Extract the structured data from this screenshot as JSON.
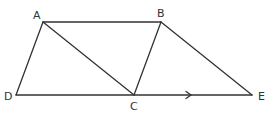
{
  "diagram": {
    "type": "geometry",
    "stroke_color": "#333333",
    "label_color": "#333333",
    "points": {
      "A": {
        "label": "A",
        "x": 43,
        "y": 22
      },
      "B": {
        "label": "B",
        "x": 161,
        "y": 22
      },
      "C": {
        "label": "C",
        "x": 134,
        "y": 95
      },
      "D": {
        "label": "D",
        "x": 16,
        "y": 95
      },
      "E": {
        "label": "E",
        "x": 252,
        "y": 95
      }
    },
    "segments": [
      {
        "from": "A",
        "to": "B"
      },
      {
        "from": "A",
        "to": "D"
      },
      {
        "from": "A",
        "to": "C"
      },
      {
        "from": "B",
        "to": "C"
      },
      {
        "from": "B",
        "to": "E"
      },
      {
        "from": "D",
        "to": "E"
      }
    ],
    "annotations": [
      {
        "type": "direction-arrow",
        "on_segment": "C-E",
        "direction": "right"
      }
    ],
    "labels": {
      "A": "A",
      "B": "B",
      "C": "C",
      "D": "D",
      "E": "E"
    }
  }
}
